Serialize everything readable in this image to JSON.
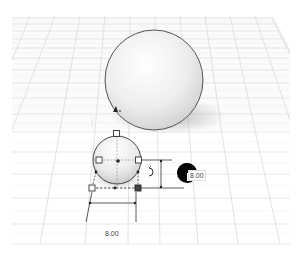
{
  "scene": {
    "type": "3d-workplane",
    "background": "#ffffff",
    "grid_color": "#d8d8d8",
    "objects": [
      {
        "name": "large-sphere",
        "shape": "sphere",
        "selected": false,
        "color": "#f2f2f2"
      },
      {
        "name": "small-sphere",
        "shape": "sphere",
        "selected": true,
        "color": "#eeeeee"
      }
    ]
  },
  "dimensions": {
    "width_label": "8.00",
    "height_label": "8.00"
  },
  "colors": {
    "outline": "#333333",
    "handle_fill": "#ffffff",
    "handle_dark": "#333333",
    "rotate_handle": "#000000"
  }
}
